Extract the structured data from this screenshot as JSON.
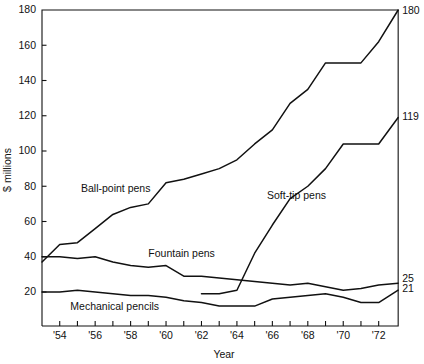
{
  "chart_data": {
    "type": "line",
    "title": "",
    "xlabel": "Year",
    "ylabel": "$ millions",
    "xlim": [
      1953,
      1973.1
    ],
    "ylim": [
      0,
      180
    ],
    "grid": false,
    "legend_position": "inline-annotations",
    "y_ticks": [
      20,
      40,
      60,
      80,
      100,
      120,
      140,
      160,
      180
    ],
    "y_tick_labels": [
      "20",
      "40",
      "60",
      "80",
      "100",
      "120",
      "140",
      "160",
      "180"
    ],
    "x_ticks": [
      1954,
      1955,
      1956,
      1957,
      1958,
      1959,
      1960,
      1961,
      1962,
      1963,
      1964,
      1965,
      1966,
      1967,
      1968,
      1969,
      1970,
      1971,
      1972
    ],
    "x_tick_labels": [
      "'54",
      "",
      "'56",
      "",
      "'58",
      "",
      "'60",
      "",
      "'62",
      "",
      "'64",
      "",
      "'66",
      "",
      "'68",
      "",
      "'70",
      "",
      "'72"
    ],
    "x_labeled_ticks": [
      {
        "x": 1954,
        "label": "'54"
      },
      {
        "x": 1956,
        "label": "'56"
      },
      {
        "x": 1958,
        "label": "'58"
      },
      {
        "x": 1960,
        "label": "'60"
      },
      {
        "x": 1962,
        "label": "'62"
      },
      {
        "x": 1964,
        "label": "'64"
      },
      {
        "x": 1966,
        "label": "'66"
      },
      {
        "x": 1968,
        "label": "'68"
      },
      {
        "x": 1970,
        "label": "'70"
      },
      {
        "x": 1972,
        "label": "'72"
      }
    ],
    "series": [
      {
        "name": "Ball-point pens",
        "end_value_label": "180",
        "x": [
          1953,
          1954,
          1955,
          1956,
          1957,
          1958,
          1959,
          1960,
          1961,
          1962,
          1963,
          1964,
          1965,
          1966,
          1967,
          1968,
          1969,
          1970,
          1971,
          1972,
          1973.1
        ],
        "values": [
          37,
          47,
          48,
          56,
          64,
          68,
          70,
          82,
          84,
          87,
          90,
          95,
          104,
          112,
          127,
          135,
          150,
          150,
          150,
          162,
          180
        ]
      },
      {
        "name": "Fountain pens",
        "end_value_label": "25",
        "x": [
          1953,
          1954,
          1955,
          1956,
          1957,
          1958,
          1959,
          1960,
          1961,
          1962,
          1963,
          1964,
          1965,
          1966,
          1967,
          1968,
          1969,
          1970,
          1971,
          1972,
          1973.1
        ],
        "values": [
          40,
          40,
          39,
          40,
          37,
          35,
          34,
          35,
          29,
          29,
          28,
          27,
          26,
          25,
          24,
          25,
          23,
          21,
          22,
          24,
          25
        ]
      },
      {
        "name": "Mechanical pencils",
        "end_value_label": "21",
        "x": [
          1953,
          1954,
          1955,
          1956,
          1957,
          1958,
          1959,
          1960,
          1961,
          1962,
          1963,
          1964,
          1965,
          1966,
          1967,
          1968,
          1969,
          1970,
          1971,
          1972,
          1973.1
        ],
        "values": [
          20,
          20,
          21,
          20,
          19,
          18,
          18,
          17,
          15,
          14,
          12,
          12,
          12,
          16,
          17,
          18,
          19,
          17,
          14,
          14,
          21
        ]
      },
      {
        "name": "Soft-tip pens",
        "end_value_label": "119",
        "x": [
          1962,
          1963,
          1964,
          1965,
          1966,
          1967,
          1968,
          1969,
          1970,
          1971,
          1972,
          1973.1
        ],
        "values": [
          19,
          19,
          21,
          42,
          58,
          73,
          80,
          90,
          104,
          104,
          104,
          119
        ]
      }
    ],
    "annotations": [
      {
        "name": "ball-point-pens-label",
        "text": "Ball-point pens",
        "x": 1955.2,
        "y": 77
      },
      {
        "name": "fountain-pens-label",
        "text": "Fountain pens",
        "x": 1959.0,
        "y": 40
      },
      {
        "name": "mechanical-pencils-label",
        "text": "Mechanical pencils",
        "x": 1954.6,
        "y": 10
      },
      {
        "name": "soft-tip-pens-label",
        "text": "Soft-tip pens",
        "x": 1965.7,
        "y": 73
      }
    ],
    "end_labels": [
      {
        "name": "end-label-ball-point",
        "text": "180",
        "value": 180
      },
      {
        "name": "end-label-soft-tip",
        "text": "119",
        "value": 119
      },
      {
        "name": "end-label-fountain",
        "text": "25",
        "value": 25
      },
      {
        "name": "end-label-mechanical",
        "text": "21",
        "value": 21
      }
    ]
  }
}
